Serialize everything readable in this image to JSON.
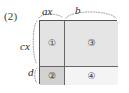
{
  "figure": {
    "number_label": "(2)",
    "kind": "area-model-rectangle-diagram"
  },
  "dimensions": {
    "top_left_label": "ax",
    "top_right_label": "b",
    "left_upper_label": "cx",
    "left_lower_label": "d"
  },
  "regions": [
    {
      "id": "1",
      "symbol": "①",
      "position": "top-left",
      "fill": "#e3e3e3"
    },
    {
      "id": "2",
      "symbol": "②",
      "position": "bottom-left",
      "fill": "#d2d2d2"
    },
    {
      "id": "3",
      "symbol": "③",
      "position": "top-right",
      "fill": "#e5e5e5"
    },
    {
      "id": "4",
      "symbol": "④",
      "position": "bottom-right",
      "fill": "#f4f4f4"
    }
  ],
  "colors": {
    "outline": "#555555",
    "divider": "#666666",
    "brace": "#8d8d8d",
    "text": "#2e2e2e",
    "background": "#ffffff"
  }
}
